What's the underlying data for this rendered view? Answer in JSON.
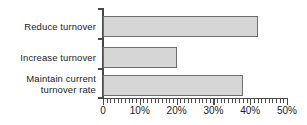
{
  "chart_data": {
    "type": "bar",
    "orientation": "horizontal",
    "title": "",
    "xlabel": "",
    "ylabel": "",
    "categories": [
      "Reduce turnover",
      "Increase turnover",
      "Maintain current\nturnover rate"
    ],
    "values": [
      42,
      20,
      38
    ],
    "xlim": [
      0,
      50
    ],
    "xticks": [
      0,
      10,
      20,
      30,
      40,
      50
    ],
    "xtick_labels": [
      "0",
      "10%",
      "20%",
      "30%",
      "40%",
      "50%"
    ],
    "minor_tick_interval": 1,
    "grid": false,
    "legend": null,
    "bar_fill_color": "#d6d6d6",
    "bar_border_color": "#6e6e6e",
    "axis_color": "#4a4a4a",
    "background_color": "#ffffff"
  }
}
